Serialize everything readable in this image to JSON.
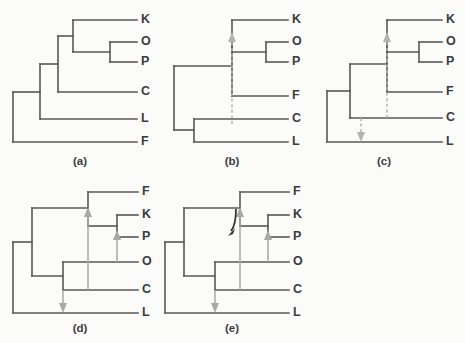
{
  "figure": {
    "background_color": "#fbfbfa",
    "line_color": "#58585a",
    "label_color": "#3c3c3e",
    "arrow_gray": "#b4b3b1",
    "arrow_dark": "#2f2f31"
  },
  "panels": [
    {
      "id": "a",
      "caption": "(a)",
      "caption_x": 80,
      "caption_y": 161,
      "tips": [
        {
          "label": "K",
          "x": 141,
          "y": 20
        },
        {
          "label": "O",
          "x": 141,
          "y": 42
        },
        {
          "label": "P",
          "x": 141,
          "y": 62
        },
        {
          "label": "C",
          "x": 141,
          "y": 92
        },
        {
          "label": "L",
          "x": 141,
          "y": 119
        },
        {
          "label": "F",
          "x": 141,
          "y": 142
        }
      ],
      "arrows": []
    },
    {
      "id": "b",
      "caption": "(b)",
      "caption_x": 232,
      "caption_y": 161,
      "tips": [
        {
          "label": "K",
          "x": 292,
          "y": 20
        },
        {
          "label": "O",
          "x": 292,
          "y": 42
        },
        {
          "label": "P",
          "x": 292,
          "y": 62
        },
        {
          "label": "F",
          "x": 292,
          "y": 96
        },
        {
          "label": "C",
          "x": 292,
          "y": 119
        },
        {
          "label": "L",
          "x": 292,
          "y": 142
        }
      ],
      "arrows": [
        {
          "style": "dashed",
          "direction": "up",
          "from_y": 124,
          "to_y": 36,
          "x": 232
        }
      ]
    },
    {
      "id": "c",
      "caption": "(c)",
      "caption_x": 384,
      "caption_y": 161,
      "tips": [
        {
          "label": "K",
          "x": 446,
          "y": 20
        },
        {
          "label": "O",
          "x": 446,
          "y": 42
        },
        {
          "label": "P",
          "x": 446,
          "y": 62
        },
        {
          "label": "F",
          "x": 446,
          "y": 92
        },
        {
          "label": "C",
          "x": 446,
          "y": 118
        },
        {
          "label": "L",
          "x": 446,
          "y": 142
        }
      ],
      "arrows": [
        {
          "style": "dashed",
          "direction": "up",
          "from_y": 118,
          "to_y": 36,
          "x": 387
        },
        {
          "style": "dashed",
          "direction": "down",
          "from_y": 118,
          "to_y": 141,
          "x": 361
        }
      ]
    },
    {
      "id": "d",
      "caption": "(d)",
      "caption_x": 80,
      "caption_y": 328,
      "tips": [
        {
          "label": "F",
          "x": 142,
          "y": 192
        },
        {
          "label": "K",
          "x": 142,
          "y": 215
        },
        {
          "label": "P",
          "x": 142,
          "y": 237
        },
        {
          "label": "O",
          "x": 142,
          "y": 262
        },
        {
          "label": "C",
          "x": 142,
          "y": 290
        },
        {
          "label": "L",
          "x": 142,
          "y": 313
        }
      ],
      "arrows": [
        {
          "style": "solid",
          "direction": "up",
          "from_y": 290,
          "to_y": 208,
          "x": 88
        },
        {
          "style": "solid",
          "direction": "up",
          "from_y": 262,
          "to_y": 231,
          "x": 117
        },
        {
          "style": "solid",
          "direction": "down",
          "from_y": 290,
          "to_y": 312,
          "x": 63
        }
      ]
    },
    {
      "id": "e",
      "caption": "(e)",
      "caption_x": 232,
      "caption_y": 328,
      "tips": [
        {
          "label": "F",
          "x": 293,
          "y": 192
        },
        {
          "label": "K",
          "x": 293,
          "y": 215
        },
        {
          "label": "P",
          "x": 293,
          "y": 237
        },
        {
          "label": "O",
          "x": 293,
          "y": 262
        },
        {
          "label": "C",
          "x": 293,
          "y": 290
        },
        {
          "label": "L",
          "x": 293,
          "y": 313
        }
      ],
      "arrows": [
        {
          "style": "solid",
          "direction": "up",
          "from_y": 290,
          "to_y": 208,
          "x": 240
        },
        {
          "style": "solid",
          "direction": "up",
          "from_y": 262,
          "to_y": 231,
          "x": 268
        },
        {
          "style": "solid",
          "direction": "down",
          "from_y": 290,
          "to_y": 312,
          "x": 215
        },
        {
          "style": "dark-hook",
          "direction": "down-left",
          "from_x": 236,
          "from_y": 208,
          "to_x": 230,
          "to_y": 234
        }
      ]
    }
  ]
}
